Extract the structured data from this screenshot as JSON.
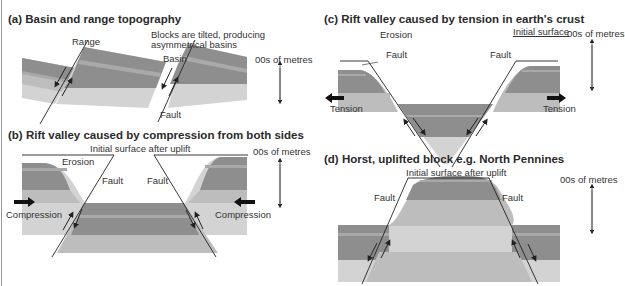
{
  "colors": {
    "layer_dark": "#8e8e8e",
    "layer_stripe": "#a9a9a9",
    "layer_mid": "#bdbdbd",
    "layer_light": "#d3d3d3",
    "line": "#222222"
  },
  "panels": {
    "a": {
      "title": "(a)  Basin and range topography",
      "labels": {
        "range": "Range",
        "basin": "Basin",
        "fault": "Fault",
        "note_line1": "Blocks are tilted, producing",
        "note_line2": "asymmetrical basins",
        "scale": "00s of metres"
      }
    },
    "b": {
      "title": "(b)  Rift valley caused by compression from both sides",
      "labels": {
        "initial_surface": "Initial surface after uplift",
        "erosion": "Erosion",
        "fault_left": "Fault",
        "fault_right": "Fault",
        "compression_left": "Compression",
        "compression_right": "Compression",
        "scale": "00s of metres"
      }
    },
    "c": {
      "title": "(c)  Rift valley caused by tension in earth's crust",
      "labels": {
        "erosion": "Erosion",
        "fault_left": "Fault",
        "fault_right": "Fault",
        "initial_surface": "Initial surface",
        "tension_left": "Tension",
        "tension_right": "Tension",
        "scale": "00s of metres"
      }
    },
    "d": {
      "title": "(d)  Horst, uplifted block e.g. North Pennines",
      "labels": {
        "initial_surface": "Initial surface after uplift",
        "fault_left": "Fault",
        "fault_right": "Fault",
        "scale": "00s of metres"
      }
    }
  }
}
